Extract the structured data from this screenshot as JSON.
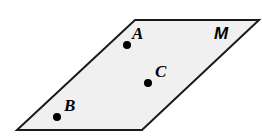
{
  "figure": {
    "type": "geometric-plane-diagram",
    "plane": {
      "name": "M",
      "label": "M",
      "label_position": {
        "x": 214,
        "y": 25
      },
      "fill_color": "#f0f0f0",
      "stroke_color": "#1a1a1a",
      "stroke_width": 2,
      "vertices": [
        {
          "x": 135,
          "y": 20
        },
        {
          "x": 259,
          "y": 20
        },
        {
          "x": 142,
          "y": 130
        },
        {
          "x": 17,
          "y": 130
        }
      ]
    },
    "points": [
      {
        "name": "A",
        "label": "A",
        "dot": {
          "x": 127,
          "y": 45,
          "r": 4
        },
        "label_position": {
          "x": 132,
          "y": 25
        },
        "color": "#000000"
      },
      {
        "name": "C",
        "label": "C",
        "dot": {
          "x": 148,
          "y": 83,
          "r": 4
        },
        "label_position": {
          "x": 155,
          "y": 63
        },
        "color": "#000000"
      },
      {
        "name": "B",
        "label": "B",
        "dot": {
          "x": 57,
          "y": 117,
          "r": 4
        },
        "label_position": {
          "x": 64,
          "y": 97
        },
        "color": "#000000"
      }
    ]
  }
}
